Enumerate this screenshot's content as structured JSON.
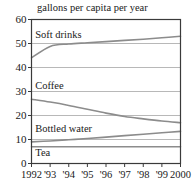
{
  "chart_data": {
    "type": "line",
    "title": "gallons per capita per year",
    "xlabel": "",
    "ylabel": "",
    "grid": true,
    "legend_position": "inline-labels",
    "xlim": [
      1992,
      2000
    ],
    "ylim": [
      0,
      60
    ],
    "yticks": [
      0,
      10,
      20,
      30,
      40,
      50,
      60
    ],
    "ytick_labels": [
      "0",
      "10",
      "20",
      "30",
      "40",
      "50",
      "60"
    ],
    "xticks": [
      1992,
      1993,
      1994,
      1995,
      1996,
      1997,
      1998,
      1999,
      2000
    ],
    "xtick_labels": [
      "1992",
      "'93",
      "'94",
      "'95",
      "'96",
      "'97",
      "'98",
      "'99",
      "2000"
    ],
    "x": [
      1992,
      1993,
      1994,
      1995,
      1996,
      1997,
      1998,
      1999,
      2000
    ],
    "series": [
      {
        "name": "Soft drinks",
        "label": "Soft drinks",
        "color": "#8c8c8c",
        "values": [
          44.0,
          48.8,
          49.8,
          50.3,
          50.8,
          51.3,
          51.8,
          52.4,
          53.0
        ]
      },
      {
        "name": "Coffee",
        "label": "Coffee",
        "color": "#8c8c8c",
        "values": [
          26.8,
          25.6,
          24.2,
          22.6,
          21.0,
          19.6,
          18.6,
          17.7,
          17.0
        ]
      },
      {
        "name": "Bottled water",
        "label": "Bottled water",
        "color": "#8c8c8c",
        "values": [
          9.0,
          9.4,
          9.9,
          10.4,
          11.0,
          11.6,
          12.2,
          12.8,
          13.4
        ]
      },
      {
        "name": "Tea",
        "label": "Tea",
        "color": "#8c8c8c",
        "values": [
          7.0,
          7.0,
          7.0,
          7.0,
          7.0,
          7.0,
          7.0,
          7.0,
          7.0
        ]
      }
    ],
    "annotations": [
      {
        "text": "Soft drinks",
        "x": 1992.2,
        "y": 52.5
      },
      {
        "text": "Coffee",
        "x": 1992.2,
        "y": 31.2
      },
      {
        "text": "Bottled water",
        "x": 1992.2,
        "y": 13.2
      },
      {
        "text": "Tea",
        "x": 1992.2,
        "y": 3.3
      }
    ],
    "colors": {
      "axis": "#3a3a3a",
      "grid": "#b0b0b0",
      "line": "#8c8c8c",
      "text": "#1a1a1a",
      "background": "#ffffff"
    }
  }
}
